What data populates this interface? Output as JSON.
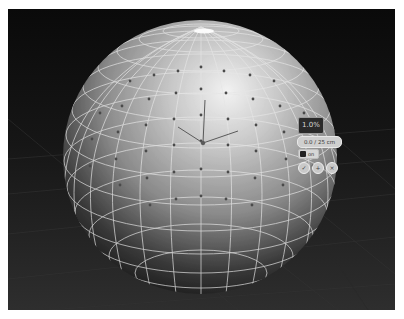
{
  "viewport": {
    "background": "#0a0a0a",
    "grid_color": "#3a3a3a",
    "object": {
      "type": "uv-sphere",
      "wireframe_color": "#e6e6e6",
      "vertex_color": "#4a4a4a",
      "highlight_color": "#f4f4f4",
      "shadow_color": "#141414"
    },
    "gizmo": {
      "label": "transform-gizmo"
    }
  },
  "widget_panel": {
    "value_box": "1.0%",
    "pill_field": "0.0 / 25 cm",
    "toggle_label": "on",
    "buttons": [
      {
        "name": "confirm",
        "glyph": "✓"
      },
      {
        "name": "add",
        "glyph": "+"
      },
      {
        "name": "close",
        "glyph": "×"
      }
    ]
  }
}
